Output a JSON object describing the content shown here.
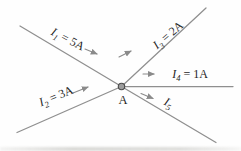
{
  "figure": {
    "node": {
      "label": "A"
    },
    "currents": [
      {
        "name": "I1",
        "symbol": "I",
        "subscript": "1",
        "value": "= 5A",
        "direction": "into-node"
      },
      {
        "name": "I2",
        "symbol": "I",
        "subscript": "2",
        "value": "= 3A",
        "direction": "into-node"
      },
      {
        "name": "I3",
        "symbol": "I",
        "subscript": "3",
        "value": "= 2A",
        "direction": "out-of-node"
      },
      {
        "name": "I4",
        "symbol": "I",
        "subscript": "4",
        "value": "= 1A",
        "direction": "out-of-node"
      },
      {
        "name": "I5",
        "symbol": "I",
        "subscript": "5",
        "value": "",
        "direction": "out-of-node"
      }
    ],
    "colors": {
      "background": "#fefefe",
      "wire": "#8f8f8f",
      "arrow": "#8a8a8a",
      "text": "#1f1f1f",
      "node_fill": "#9c9c9c",
      "node_stroke": "#4a4a4a"
    }
  }
}
